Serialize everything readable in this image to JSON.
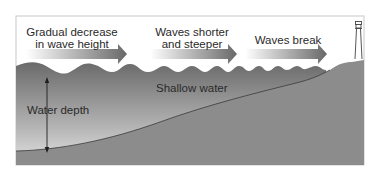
{
  "diagram": {
    "labels": {
      "stage1_line1": "Gradual decrease",
      "stage1_line2": "in wave height",
      "stage2_line1": "Waves shorter",
      "stage2_line2": "and steeper",
      "stage3": "Waves break",
      "shallow": "Shallow water",
      "depth": "Water depth"
    },
    "icons": [
      "arrow-right-icon",
      "arrow-right-icon",
      "arrow-right-icon",
      "lighthouse-icon",
      "double-arrow-vertical-icon"
    ],
    "colors": {
      "water_top": "#6e6e6e",
      "water_bottom": "#f4f4f4",
      "seabed": "#8a8a8a",
      "arrow_start": "#ffffff",
      "arrow_end": "#6a6a6a",
      "frame": "#c8c8c8",
      "text": "#2a2a2a"
    }
  }
}
